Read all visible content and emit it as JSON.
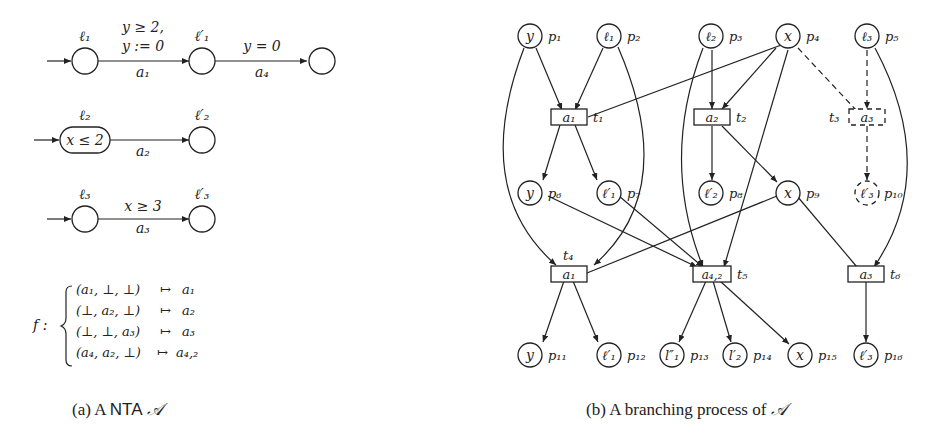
{
  "figure_a": {
    "caption_prefix": "(a) A ",
    "caption_nta": "NTA",
    "caption_symbol": "𝒜",
    "automaton1": {
      "loc_start": "ℓ₁",
      "loc_mid": "ℓ′₁",
      "edge1_guard": "y ≥ 2,",
      "edge1_reset": "y := 0",
      "edge1_action": "a₁",
      "edge2_guard": "y = 0",
      "edge2_action": "a₄"
    },
    "automaton2": {
      "loc_start": "ℓ₂",
      "invariant": "x ≤ 2",
      "loc_end": "ℓ′₂",
      "edge_action": "a₂"
    },
    "automaton3": {
      "loc_start": "ℓ₃",
      "loc_end": "ℓ′₃",
      "edge_guard": "x ≥ 3",
      "edge_action": "a₃"
    },
    "sync_function": {
      "name": "f :",
      "rows": [
        {
          "vector": "(a₁, ⊥, ⊥)",
          "maps": "↦",
          "result": "a₁"
        },
        {
          "vector": "(⊥, a₂, ⊥)",
          "maps": "↦",
          "result": "a₂"
        },
        {
          "vector": "(⊥, ⊥, a₃)",
          "maps": "↦",
          "result": "a₃"
        },
        {
          "vector": "(a₄, a₂, ⊥)",
          "maps": "↦",
          "result": "a₄,₂"
        }
      ]
    }
  },
  "figure_b": {
    "caption_prefix": "(b) A branching process of ",
    "caption_symbol": "𝒜",
    "places": [
      {
        "id": "p1",
        "label": "y",
        "name": "p₁"
      },
      {
        "id": "p2",
        "label": "ℓ₁",
        "name": "p₂"
      },
      {
        "id": "p3",
        "label": "ℓ₂",
        "name": "p₃"
      },
      {
        "id": "p4",
        "label": "x",
        "name": "p₄"
      },
      {
        "id": "p5",
        "label": "ℓ₃",
        "name": "p₅"
      },
      {
        "id": "p6",
        "label": "y",
        "name": "p₆"
      },
      {
        "id": "p7",
        "label": "ℓ′₁",
        "name": "p₇"
      },
      {
        "id": "p8",
        "label": "ℓ′₂",
        "name": "p₈"
      },
      {
        "id": "p9",
        "label": "x",
        "name": "p₉"
      },
      {
        "id": "p10",
        "label": "ℓ′₃",
        "name": "p₁₀"
      },
      {
        "id": "p11",
        "label": "y",
        "name": "p₁₁"
      },
      {
        "id": "p12",
        "label": "ℓ′₁",
        "name": "p₁₂"
      },
      {
        "id": "p13",
        "label": "l″₁",
        "name": "p₁₃"
      },
      {
        "id": "p14",
        "label": "l′₂",
        "name": "p₁₄"
      },
      {
        "id": "p15",
        "label": "x",
        "name": "p₁₅"
      },
      {
        "id": "p16",
        "label": "ℓ′₃",
        "name": "p₁₆"
      }
    ],
    "transitions": [
      {
        "id": "t1",
        "label": "a₁",
        "name": "t₁"
      },
      {
        "id": "t2",
        "label": "a₂",
        "name": "t₂"
      },
      {
        "id": "t3",
        "label": "a₃",
        "name": "t₃",
        "dashed": true
      },
      {
        "id": "t4",
        "label": "a₁",
        "name": "t₄"
      },
      {
        "id": "t5",
        "label": "a₄,₂",
        "name": "t₅"
      },
      {
        "id": "t6",
        "label": "a₃",
        "name": "t₆"
      }
    ]
  }
}
